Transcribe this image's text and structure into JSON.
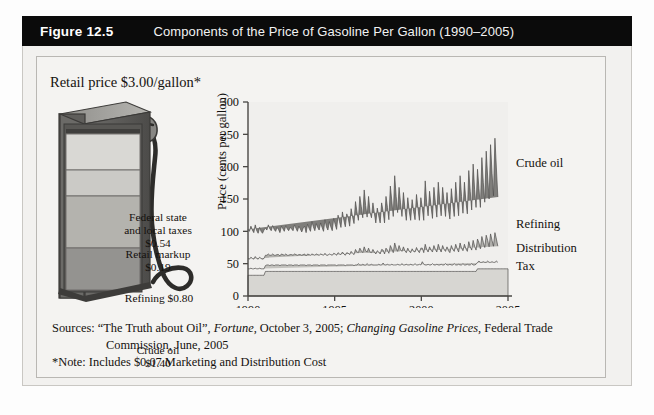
{
  "header": {
    "figure_number": "Figure 12.5",
    "title": "Components of the Price of Gasoline Per Gallon (1990–2005)"
  },
  "pump": {
    "retail_caption": "Retail price $3.00/gallon*",
    "segments": [
      {
        "name": "federal-state-local-taxes",
        "label": "Federal state\nand local taxes\n$0.54",
        "value": 0.54,
        "color": "#d9d8d4"
      },
      {
        "name": "retail-markup",
        "label": "Retail markup\n$0.19",
        "value": 0.19,
        "color": "#cbcac6"
      },
      {
        "name": "refining",
        "label": "Refining $0.80",
        "value": 0.8,
        "color": "#b4b3ae"
      },
      {
        "name": "crude-oil",
        "label": "Crude oil\n$1.40",
        "value": 1.4,
        "color": "#949390"
      }
    ],
    "total": 3.0
  },
  "chart_data": {
    "type": "area",
    "title": "Components of the Price of Gasoline Per Gallon (1990–2005)",
    "xlabel": "",
    "ylabel": "Price (cents per gallon)",
    "xlim": [
      1990,
      2005
    ],
    "ylim": [
      0,
      300
    ],
    "yticks": [
      0,
      50,
      100,
      150,
      200,
      250,
      300
    ],
    "xticks": [
      1990,
      1995,
      2000,
      2005
    ],
    "grid": false,
    "legend_position": "right-inline",
    "stacked": true,
    "series": [
      {
        "name": "Tax",
        "color": "#d7d6d2",
        "values": [
          32,
          32,
          32,
          32,
          32,
          32,
          32,
          32,
          32,
          32,
          32,
          32,
          38,
          38,
          38,
          38,
          38,
          38,
          38,
          38,
          38,
          38,
          38,
          38,
          38,
          38,
          38,
          38,
          38,
          38,
          38,
          38,
          38,
          38,
          38,
          38,
          38,
          38,
          38,
          38,
          38,
          38,
          38,
          38,
          38,
          38,
          38,
          38,
          38,
          38,
          38,
          38,
          38,
          38,
          38,
          38,
          38,
          38,
          38,
          38,
          38,
          38,
          38,
          38,
          38,
          38,
          38,
          38,
          38,
          38,
          38,
          38,
          38,
          38,
          38,
          38,
          38,
          38,
          38,
          38,
          38,
          38,
          38,
          38,
          38,
          38,
          38,
          38,
          38,
          38,
          38,
          38,
          38,
          38,
          38,
          38,
          38,
          38,
          38,
          38,
          38,
          38,
          38,
          38,
          38,
          38,
          38,
          38,
          38,
          38,
          38,
          38,
          38,
          38,
          38,
          38,
          38,
          38,
          38,
          38,
          38,
          38,
          38,
          38,
          38,
          38,
          38,
          38,
          38,
          38,
          38,
          38,
          38,
          38,
          38,
          38,
          38,
          38,
          38,
          38,
          38,
          38,
          38,
          38,
          38,
          38,
          38,
          38,
          38,
          38,
          38,
          38,
          38,
          38,
          38,
          38,
          38,
          38,
          42,
          42,
          42,
          42,
          42,
          42,
          42,
          42,
          42,
          42,
          42,
          42,
          42,
          42,
          42,
          42,
          42,
          42,
          42,
          42,
          42,
          42
        ]
      },
      {
        "name": "Distribution",
        "color": "#c3c2be",
        "values": [
          10,
          10,
          11,
          10,
          10,
          11,
          10,
          10,
          11,
          10,
          10,
          10,
          9,
          10,
          10,
          9,
          10,
          10,
          9,
          10,
          10,
          10,
          9,
          10,
          10,
          10,
          10,
          9,
          10,
          10,
          10,
          9,
          10,
          10,
          10,
          9,
          10,
          10,
          10,
          10,
          9,
          10,
          10,
          10,
          9,
          10,
          10,
          10,
          10,
          9,
          10,
          10,
          10,
          10,
          9,
          10,
          10,
          10,
          10,
          10,
          10,
          9,
          10,
          10,
          10,
          10,
          10,
          9,
          10,
          10,
          10,
          10,
          10,
          9,
          10,
          10,
          12,
          10,
          10,
          11,
          10,
          10,
          12,
          10,
          10,
          11,
          10,
          10,
          10,
          10,
          11,
          10,
          10,
          13,
          10,
          10,
          11,
          10,
          10,
          11,
          10,
          10,
          10,
          11,
          10,
          10,
          12,
          10,
          10,
          11,
          10,
          10,
          11,
          10,
          10,
          12,
          10,
          10,
          11,
          10,
          15,
          11,
          10,
          10,
          11,
          10,
          10,
          12,
          10,
          10,
          11,
          10,
          10,
          11,
          10,
          10,
          12,
          10,
          10,
          11,
          10,
          10,
          12,
          10,
          10,
          11,
          10,
          10,
          12,
          10,
          10,
          11,
          10,
          10,
          12,
          10,
          10,
          11,
          10,
          12,
          10,
          10,
          11,
          10,
          10,
          12,
          10,
          10,
          11,
          10,
          10,
          12,
          10
        ]
      },
      {
        "name": "Refining",
        "color": "#b0afab",
        "values": [
          16,
          15,
          17,
          16,
          15,
          18,
          16,
          15,
          17,
          16,
          15,
          16,
          16,
          15,
          17,
          16,
          15,
          17,
          16,
          15,
          16,
          16,
          15,
          17,
          16,
          15,
          17,
          16,
          15,
          16,
          16,
          16,
          17,
          16,
          15,
          17,
          16,
          15,
          16,
          17,
          15,
          17,
          16,
          15,
          18,
          16,
          15,
          17,
          16,
          16,
          17,
          16,
          15,
          18,
          16,
          15,
          17,
          16,
          15,
          18,
          17,
          16,
          19,
          17,
          16,
          20,
          17,
          16,
          19,
          18,
          16,
          21,
          18,
          17,
          24,
          20,
          17,
          26,
          22,
          18,
          28,
          22,
          18,
          26,
          20,
          18,
          24,
          20,
          17,
          22,
          19,
          17,
          24,
          20,
          17,
          26,
          22,
          18,
          30,
          24,
          19,
          34,
          26,
          20,
          30,
          24,
          19,
          28,
          22,
          18,
          26,
          21,
          18,
          25,
          21,
          18,
          27,
          22,
          18,
          26,
          21,
          18,
          32,
          24,
          19,
          28,
          23,
          18,
          30,
          24,
          19,
          32,
          25,
          19,
          30,
          24,
          19,
          28,
          22,
          18,
          30,
          24,
          19,
          32,
          25,
          19,
          34,
          26,
          20,
          32,
          25,
          20,
          36,
          28,
          21,
          38,
          29,
          22,
          36,
          28,
          21,
          40,
          30,
          23,
          42,
          32,
          24,
          44,
          33,
          25,
          46,
          34,
          25,
          44,
          33,
          25,
          42,
          32,
          24,
          40
        ]
      },
      {
        "name": "Crude oil",
        "color": "#7f7e7b",
        "values": [
          45,
          43,
          48,
          44,
          41,
          49,
          43,
          40,
          46,
          42,
          40,
          44,
          42,
          39,
          45,
          41,
          38,
          44,
          40,
          37,
          42,
          39,
          36,
          43,
          40,
          37,
          44,
          41,
          38,
          42,
          40,
          38,
          45,
          41,
          37,
          44,
          40,
          36,
          41,
          43,
          36,
          46,
          41,
          37,
          50,
          43,
          38,
          47,
          42,
          39,
          48,
          42,
          37,
          52,
          44,
          39,
          50,
          43,
          38,
          54,
          46,
          40,
          58,
          50,
          42,
          62,
          52,
          44,
          60,
          54,
          44,
          66,
          56,
          48,
          74,
          62,
          50,
          80,
          68,
          54,
          88,
          70,
          54,
          80,
          62,
          54,
          72,
          60,
          48,
          66,
          56,
          48,
          72,
          60,
          48,
          80,
          66,
          52,
          92,
          74,
          56,
          104,
          80,
          60,
          90,
          72,
          54,
          84,
          66,
          50,
          78,
          62,
          50,
          76,
          62,
          50,
          82,
          66,
          50,
          78,
          62,
          50,
          98,
          72,
          56,
          86,
          68,
          52,
          90,
          72,
          54,
          96,
          74,
          56,
          90,
          72,
          54,
          84,
          64,
          52,
          88,
          70,
          54,
          96,
          74,
          56,
          104,
          80,
          58,
          96,
          74,
          58,
          110,
          86,
          62,
          118,
          88,
          66,
          108,
          84,
          64,
          122,
          92,
          70,
          130,
          98,
          74,
          138,
          104,
          78,
          146,
          110,
          76,
          132,
          100,
          76,
          124,
          96,
          72,
          190
        ]
      }
    ],
    "series_labels": [
      {
        "name": "Crude oil",
        "x": 512,
        "y": 167
      },
      {
        "name": "Refining",
        "x": 512,
        "y": 228
      },
      {
        "name": "Distribution",
        "x": 512,
        "y": 252
      },
      {
        "name": "Tax",
        "x": 512,
        "y": 270
      }
    ],
    "peak": {
      "year": 2005,
      "value": 290
    }
  },
  "sources": {
    "label": "Sources:",
    "line1_a": " “The Truth about Oil”, ",
    "line1_italic1": "Fortune",
    "line1_b": ", October 3, 2005; ",
    "line1_italic2": "Changing Gasoline Prices",
    "line1_c": ", Federal Trade",
    "line2": "Commission, June, 2005",
    "note": "*Note: Includes $0.07 Marketing and Distribution Cost"
  },
  "colors": {
    "header_bar": "#0b0b0b",
    "panel_bg": "#f4f3f1",
    "crude": "#7f7e7b",
    "refining": "#b0afab",
    "distribution": "#c3c2be",
    "tax": "#d7d6d2",
    "axis": "#4a4845"
  }
}
